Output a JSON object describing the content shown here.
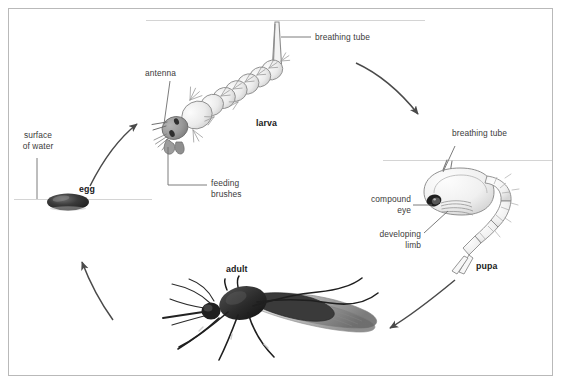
{
  "figure": {
    "border_color": "#b9b9b9",
    "background": "#ffffff",
    "label_color": "#3b3b3b",
    "bold_label_color": "#1a1a1a",
    "arrow_color": "#4a4a4a",
    "leader_color": "#6d6d6d",
    "waterline_color": "#cfcfcf",
    "egg_color": "#2b2b2b",
    "adult_color": "#2a2a2a",
    "larva_color": "#8a8a8a",
    "pupa_color": "#7d7d7d"
  },
  "stages": [
    {
      "id": "egg",
      "label": "egg"
    },
    {
      "id": "larva",
      "label": "larva"
    },
    {
      "id": "pupa",
      "label": "pupa"
    },
    {
      "id": "adult",
      "label": "adult"
    }
  ],
  "annotations": {
    "surface_of_water": "surface\nof water",
    "antenna": "antenna",
    "feeding_brushes": "feeding\nbrushes",
    "breathing_tube_larva": "breathing tube",
    "breathing_tube_pupa": "breathing tube",
    "compound_eye": "compound\neye",
    "developing_limb": "developing\nlimb"
  },
  "arrows": [
    {
      "id": "egg-to-larva",
      "from": "egg",
      "to": "larva"
    },
    {
      "id": "larva-to-pupa",
      "from": "larva",
      "to": "pupa"
    },
    {
      "id": "pupa-to-adult",
      "from": "pupa",
      "to": "adult"
    },
    {
      "id": "adult-to-egg",
      "from": "adult",
      "to": "egg"
    }
  ]
}
